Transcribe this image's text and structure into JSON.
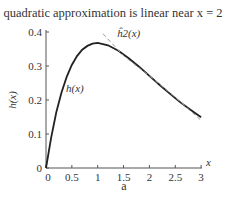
{
  "chart_data": {
    "type": "line",
    "title": "quadratic approximation is linear near x = 2",
    "xlabel": "x",
    "ylabel": "h(x)",
    "caption": "a",
    "xlim": [
      0,
      3
    ],
    "ylim": [
      0,
      0.4
    ],
    "x_ticks": [
      "0",
      "0.5",
      "1",
      "1.5",
      "2",
      "2.5",
      "3"
    ],
    "y_ticks": [
      "0",
      "0.1",
      "0.2",
      "0.3",
      "0.4"
    ],
    "grid": false,
    "series": [
      {
        "name": "h(x)",
        "style": "solid",
        "color": "#222222",
        "x": [
          0,
          0.1,
          0.2,
          0.3,
          0.4,
          0.5,
          0.6,
          0.7,
          0.8,
          0.9,
          1.0,
          1.2,
          1.4,
          1.6,
          1.8,
          2.0,
          2.2,
          2.4,
          2.6,
          2.8,
          3.0
        ],
        "y": [
          0,
          0.09,
          0.164,
          0.222,
          0.268,
          0.303,
          0.329,
          0.348,
          0.359,
          0.366,
          0.368,
          0.361,
          0.345,
          0.323,
          0.298,
          0.271,
          0.244,
          0.218,
          0.193,
          0.171,
          0.149
        ]
      },
      {
        "name": "ĥ2(x)",
        "style": "dashed",
        "color": "#999999",
        "x": [
          1.1,
          1.5,
          2.0,
          2.5,
          3.0
        ],
        "y": [
          0.395,
          0.33,
          0.271,
          0.208,
          0.14
        ]
      }
    ],
    "annotations": [
      {
        "text": "h(x)",
        "x": 0.62,
        "y": 0.235
      },
      {
        "text": "ĥ2(x)",
        "x": 1.6,
        "y": 0.385
      }
    ]
  }
}
